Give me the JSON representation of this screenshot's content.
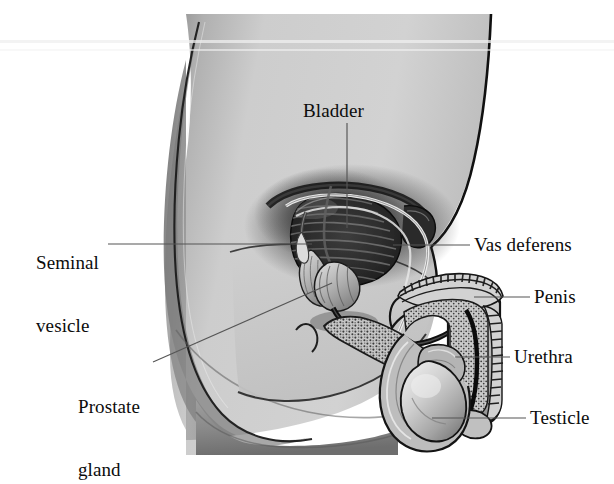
{
  "figure": {
    "style": "grayscale medical illustration",
    "background_color": "#ffffff",
    "skin_fill_color": "#c9c9c9",
    "outline_color": "#101010",
    "leader_line_color": "#4a4a4a",
    "label_text_color": "#0c0c0c"
  },
  "labels": {
    "bladder": "Bladder",
    "seminal_vesicle_line1": "Seminal",
    "seminal_vesicle_line2": "vesicle",
    "prostate_line1": "Prostate",
    "prostate_line2": "gland",
    "vas_deferens": "Vas deferens",
    "penis": "Penis",
    "urethra": "Urethra",
    "testicle": "Testicle"
  },
  "callouts": [
    {
      "name": "bladder",
      "text": "Bladder",
      "side": "top",
      "label_x": 303,
      "label_y": 100,
      "leader": "vertical down from label to bladder dome"
    },
    {
      "name": "seminal-vesicle",
      "text": "Seminal vesicle",
      "side": "left",
      "label_x": 36,
      "label_y": 220,
      "leader": "horizontal right to seminal vesicle"
    },
    {
      "name": "prostate-gland",
      "text": "Prostate gland",
      "side": "left",
      "label_x": 78,
      "label_y": 362,
      "leader": "diagonal up-right to prostate"
    },
    {
      "name": "vas-deferens",
      "text": "Vas deferens",
      "side": "right",
      "label_x": 472,
      "label_y": 234,
      "leader": "horizontal left to vas deferens duct"
    },
    {
      "name": "penis",
      "text": "Penis",
      "side": "right",
      "label_x": 533,
      "label_y": 286,
      "leader": "horizontal left to penile shaft"
    },
    {
      "name": "urethra",
      "text": "Urethra",
      "side": "right",
      "label_x": 513,
      "label_y": 347,
      "leader": "horizontal left to urethral canal"
    },
    {
      "name": "testicle",
      "text": "Testicle",
      "side": "right",
      "label_x": 529,
      "label_y": 407,
      "leader": "horizontal left to testicle"
    }
  ],
  "anatomy_parts": [
    "bladder",
    "seminal vesicle",
    "prostate gland",
    "vas deferens",
    "penis",
    "urethra",
    "testicle",
    "scrotum",
    "pelvic cavity",
    "rectum"
  ]
}
